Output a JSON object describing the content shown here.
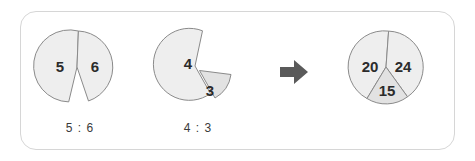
{
  "panel": {
    "border_color": "#d6d6d6",
    "background": "#ffffff"
  },
  "colors": {
    "slice_light": "#eeeeee",
    "slice_dark": "#e2e2e2",
    "slice_stroke": "#8a8a8a",
    "number_text": "#2b2b2b",
    "ratio_text": "#3a3a3a",
    "arrow": "#5a5a5a"
  },
  "figures": [
    {
      "name": "ratio-pie-5-6",
      "caption": "5 : 6",
      "slices": [
        {
          "label": "5",
          "shade": "light"
        },
        {
          "label": "6",
          "shade": "light"
        }
      ]
    },
    {
      "name": "ratio-pie-4-3",
      "caption": "4 : 3",
      "slices": [
        {
          "label": "4",
          "shade": "light"
        },
        {
          "label": "3",
          "shade": "dark"
        }
      ]
    },
    {
      "name": "result-pie-20-24-15",
      "caption": "",
      "slices": [
        {
          "label": "20",
          "shade": "light"
        },
        {
          "label": "24",
          "shade": "light"
        },
        {
          "label": "15",
          "shade": "dark"
        }
      ]
    }
  ],
  "arrow": {
    "icon": "arrow-right-icon",
    "direction": "right"
  }
}
